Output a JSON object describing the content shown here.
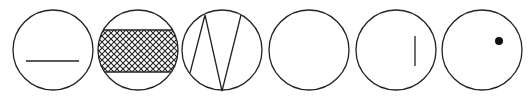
{
  "figure": {
    "stroke_color": "#222222",
    "background": "#ffffff",
    "circles": [
      {
        "id": 1,
        "cx": 53,
        "cy": 50,
        "r": 40,
        "content": "horizontal-line"
      },
      {
        "id": 2,
        "cx": 138,
        "cy": 50,
        "r": 40,
        "content": "crosshatched-band"
      },
      {
        "id": 3,
        "cx": 222,
        "cy": 50,
        "r": 40,
        "content": "zigzag-chords"
      },
      {
        "id": 4,
        "cx": 309,
        "cy": 50,
        "r": 40,
        "content": "empty"
      },
      {
        "id": 5,
        "cx": 396,
        "cy": 50,
        "r": 40,
        "content": "vertical-line"
      },
      {
        "id": 6,
        "cx": 482,
        "cy": 50,
        "r": 40,
        "content": "dot"
      }
    ]
  }
}
